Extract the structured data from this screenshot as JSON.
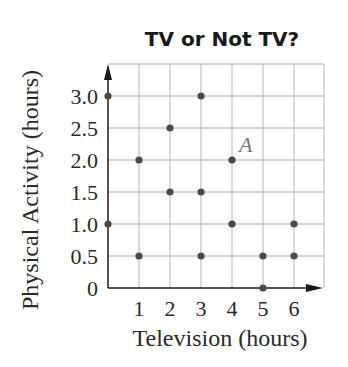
{
  "chart_data": {
    "type": "scatter",
    "title": "TV or Not TV?",
    "xlabel": "Television (hours)",
    "ylabel": "Physical Activity (hours)",
    "xlim": [
      0,
      7
    ],
    "ylim": [
      0,
      3.5
    ],
    "x_ticks": [
      "1",
      "2",
      "3",
      "4",
      "5",
      "6"
    ],
    "y_ticks": [
      "0",
      "0.5",
      "1.0",
      "1.5",
      "2.0",
      "2.5",
      "3.0"
    ],
    "grid": true,
    "points": [
      {
        "x": 0,
        "y": 3.0
      },
      {
        "x": 0,
        "y": 1.0
      },
      {
        "x": 1,
        "y": 2.0
      },
      {
        "x": 1,
        "y": 0.5
      },
      {
        "x": 2,
        "y": 2.5
      },
      {
        "x": 2,
        "y": 1.5
      },
      {
        "x": 3,
        "y": 3.0
      },
      {
        "x": 3,
        "y": 1.5
      },
      {
        "x": 3,
        "y": 0.5
      },
      {
        "x": 4,
        "y": 2.0,
        "label": "A"
      },
      {
        "x": 4,
        "y": 1.0
      },
      {
        "x": 5,
        "y": 0.5
      },
      {
        "x": 5,
        "y": 0
      },
      {
        "x": 6,
        "y": 1.0
      },
      {
        "x": 6,
        "y": 0.5
      }
    ],
    "annotations": [
      {
        "text": "A",
        "x": 4,
        "y": 2.0
      }
    ],
    "colors": {
      "point": "#4a4a4a",
      "grid": "#c8c8c8",
      "axis": "#1a1a1a",
      "annotation": "#777777"
    }
  }
}
